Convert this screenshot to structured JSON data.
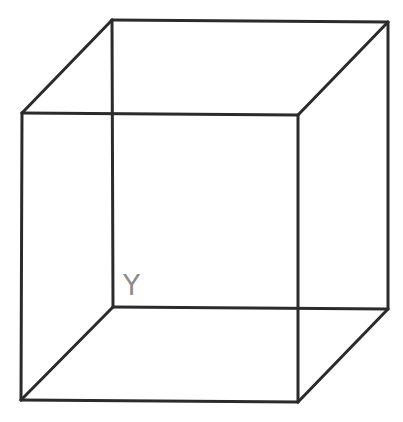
{
  "diagram": {
    "type": "wireframe-cube",
    "colors": {
      "background": "#ffffff",
      "edge": "#2b2b2b",
      "label": "#8c8c8c"
    },
    "vertices": {
      "back_top_left": [
        112,
        20
      ],
      "back_top_right": [
        388,
        22
      ],
      "back_bottom_left": [
        113,
        307
      ],
      "back_bottom_right": [
        388,
        309
      ],
      "front_top_left": [
        22,
        113
      ],
      "front_top_right": [
        298,
        115
      ],
      "front_bottom_left": [
        21,
        400
      ],
      "front_bottom_right": [
        298,
        402
      ]
    },
    "labels": [
      {
        "text": "Y",
        "vertex": "back_bottom_left",
        "position": [
          124,
          272
        ]
      }
    ]
  }
}
